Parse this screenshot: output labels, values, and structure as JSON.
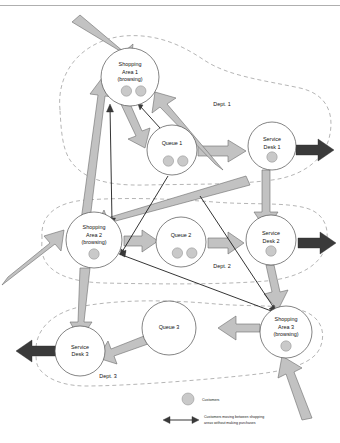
{
  "diagram": {
    "top_rule": true,
    "departments": [
      {
        "id": "dept1",
        "label": "Dept. 1"
      },
      {
        "id": "dept2",
        "label": "Dept. 2"
      },
      {
        "id": "dept3",
        "label": "Dept. 3"
      }
    ],
    "nodes": [
      {
        "id": "shop1",
        "label_line1": "Shopping",
        "label_line2": "Area 1",
        "label_line3": "(browsing)",
        "customers": 2,
        "cx": 130,
        "cy": 77,
        "r": 29
      },
      {
        "id": "queue1",
        "label_line1": "Queue 1",
        "label_line2": "",
        "label_line3": "",
        "customers": 2,
        "cx": 172,
        "cy": 150,
        "r": 25
      },
      {
        "id": "desk1",
        "label_line1": "Service",
        "label_line2": "Desk 1",
        "label_line3": "",
        "customers": 1,
        "cx": 272,
        "cy": 146,
        "r": 24
      },
      {
        "id": "shop2",
        "label_line1": "Shopping",
        "label_line2": "Area 2",
        "label_line3": "(browsing)",
        "customers": 1,
        "cx": 94,
        "cy": 240,
        "r": 28
      },
      {
        "id": "queue2",
        "label_line1": "Queue 2",
        "label_line2": "",
        "label_line3": "",
        "customers": 2,
        "cx": 181,
        "cy": 242,
        "r": 25
      },
      {
        "id": "desk2",
        "label_line1": "Service",
        "label_line2": "Desk 2",
        "label_line3": "",
        "customers": 1,
        "cx": 271,
        "cy": 240,
        "r": 25
      },
      {
        "id": "desk3",
        "label_line1": "Service",
        "label_line2": "Desk 3",
        "label_line3": "",
        "customers": 0,
        "cx": 80,
        "cy": 351,
        "r": 25
      },
      {
        "id": "queue3",
        "label_line1": "Queue 3",
        "label_line2": "",
        "label_line3": "",
        "customers": 0,
        "cx": 169,
        "cy": 328,
        "r": 27
      },
      {
        "id": "shop3",
        "label_line1": "Shopping",
        "label_line2": "Area 3",
        "label_line3": "(browsing)",
        "customers": 1,
        "cx": 286,
        "cy": 332,
        "r": 26
      }
    ],
    "legend": {
      "customer_marker_label": "Customers",
      "browsing_flow_label_line1": "Customers moving between shopping",
      "browsing_flow_label_line2": "areas without making purchases"
    },
    "colors": {
      "flow_arrow_fill": "#c2c2c2",
      "flow_arrow_stroke": "#6b6b6b",
      "exit_arrow_fill": "#3a3a3a",
      "node_stroke": "#4f4f4f",
      "customer_dot_fill": "#c9c9c9",
      "dept_outline": "#8d8d8d",
      "background": "#ffffff"
    }
  }
}
